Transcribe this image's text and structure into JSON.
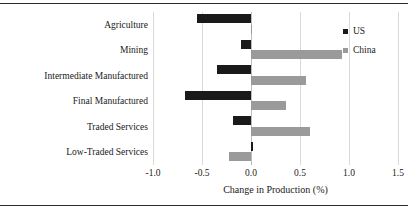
{
  "figure": {
    "background": "#ffffff",
    "rule_color": "#2a2a2a"
  },
  "chart_data": {
    "type": "bar",
    "orientation": "horizontal",
    "title": "",
    "subtitle": "",
    "xlabel": "Change in Production (%)",
    "ylabel": "",
    "xlim": [
      -1.0,
      1.5
    ],
    "xticks": [
      -1.0,
      -0.5,
      0.0,
      0.5,
      1.0,
      1.5
    ],
    "xticklabels": [
      "-1.0",
      "-0.5",
      "0.0",
      "0.5",
      "1.0",
      "1.5"
    ],
    "grid": true,
    "grid_axis": "x",
    "legend_position": "top-right",
    "categories": [
      "Agriculture",
      "Mining",
      "Intermediate Manufactured",
      "Final Manufactured",
      "Traded Services",
      "Low-Traded Services"
    ],
    "series": [
      {
        "name": "US",
        "color": "#1a1a1a",
        "values": [
          -0.55,
          -0.1,
          -0.35,
          -0.67,
          -0.18,
          0.02
        ]
      },
      {
        "name": "China",
        "color": "#9a9a9a",
        "values": [
          0.01,
          0.93,
          0.56,
          0.36,
          0.6,
          -0.22
        ]
      }
    ],
    "annotations": []
  },
  "legend": {
    "items": [
      {
        "label": "US",
        "color": "#1a1a1a",
        "swatch": "square-swatch"
      },
      {
        "label": "China",
        "color": "#9a9a9a",
        "swatch": "square-swatch"
      }
    ]
  }
}
